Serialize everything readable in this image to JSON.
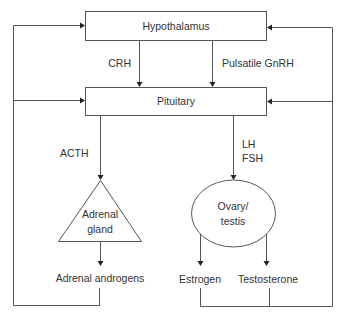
{
  "diagram": {
    "nodes": {
      "hypothalamus": {
        "label": "Hypothalamus",
        "shape": "rectangle"
      },
      "pituitary": {
        "label": "Pituitary",
        "shape": "rectangle"
      },
      "adrenal": {
        "label_line1": "Adrenal",
        "label_line2": "gland",
        "shape": "triangle"
      },
      "gonad": {
        "label_line1": "Ovary/",
        "label_line2": "testis",
        "shape": "ellipse"
      },
      "adrenal_androgens": {
        "label": "Adrenal androgens"
      },
      "estrogen": {
        "label": "Estrogen"
      },
      "testosterone": {
        "label": "Testosterone"
      }
    },
    "edges": {
      "crh": {
        "label": "CRH",
        "from": "Hypothalamus",
        "to": "Pituitary"
      },
      "gnrh": {
        "label": "Pulsatile GnRH",
        "from": "Hypothalamus",
        "to": "Pituitary"
      },
      "acth": {
        "label": "ACTH",
        "from": "Pituitary",
        "to": "Adrenal gland"
      },
      "lh_fsh": {
        "label_line1": "LH",
        "label_line2": "FSH",
        "from": "Pituitary",
        "to": "Ovary/testis"
      },
      "adrenal_out": {
        "from": "Adrenal gland",
        "to": "Adrenal androgens"
      },
      "gonad_estrogen": {
        "from": "Ovary/testis",
        "to": "Estrogen"
      },
      "gonad_testosterone": {
        "from": "Ovary/testis",
        "to": "Testosterone"
      },
      "feedback_left": {
        "from": "Adrenal androgens",
        "to": [
          "Hypothalamus",
          "Pituitary"
        ],
        "type": "feedback"
      },
      "feedback_right": {
        "from": [
          "Estrogen",
          "Testosterone"
        ],
        "to": [
          "Hypothalamus",
          "Pituitary"
        ],
        "type": "feedback"
      }
    },
    "colors": {
      "line": "#555555",
      "text": "#333333",
      "background": "#ffffff"
    }
  }
}
